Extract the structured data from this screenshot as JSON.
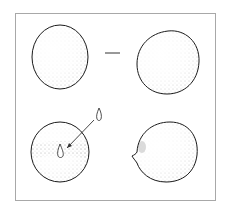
{
  "figure": {
    "type": "stippled scientific illustration",
    "panels": [
      {
        "position": "top-left",
        "shape": "round-sphere",
        "feature": "none"
      },
      {
        "position": "top-right",
        "shape": "ovoid-sphere",
        "feature": "none"
      },
      {
        "position": "bottom-left",
        "shape": "sphere-with-equatorial-band",
        "feature": "droplet-inset-with-arrow"
      },
      {
        "position": "bottom-right",
        "shape": "ovoid-with-small-protrusion",
        "feature": "left-side-bump"
      }
    ],
    "separator": "dash",
    "colors": {
      "frame": "#a8a8a8",
      "outline": "#1a1a1a",
      "stipple": "#555555",
      "background": "#ffffff"
    }
  }
}
